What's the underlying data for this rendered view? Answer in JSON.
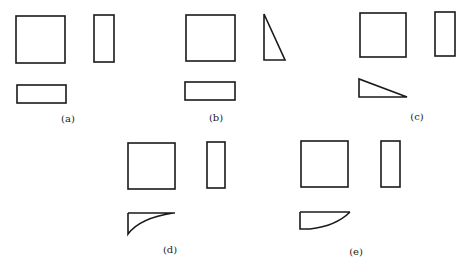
{
  "figure": {
    "panels": [
      {
        "id": "a",
        "label": "(a)",
        "front_view": "square",
        "side_view": "rectangle",
        "top_view": "rectangle"
      },
      {
        "id": "b",
        "label": "(b)",
        "front_view": "square",
        "side_view": "right-triangle",
        "top_view": "rectangle"
      },
      {
        "id": "c",
        "label": "(c)",
        "front_view": "square",
        "side_view": "rectangle",
        "top_view": "right-triangle"
      },
      {
        "id": "d",
        "label": "(d)",
        "front_view": "square",
        "side_view": "rectangle",
        "top_view": "concave-curved-triangle"
      },
      {
        "id": "e",
        "label": "(e)",
        "front_view": "square",
        "side_view": "rectangle",
        "top_view": "convex-curved-segment"
      }
    ]
  },
  "colors": {
    "stroke": "#1a1a1a",
    "background": "#ffffff"
  }
}
